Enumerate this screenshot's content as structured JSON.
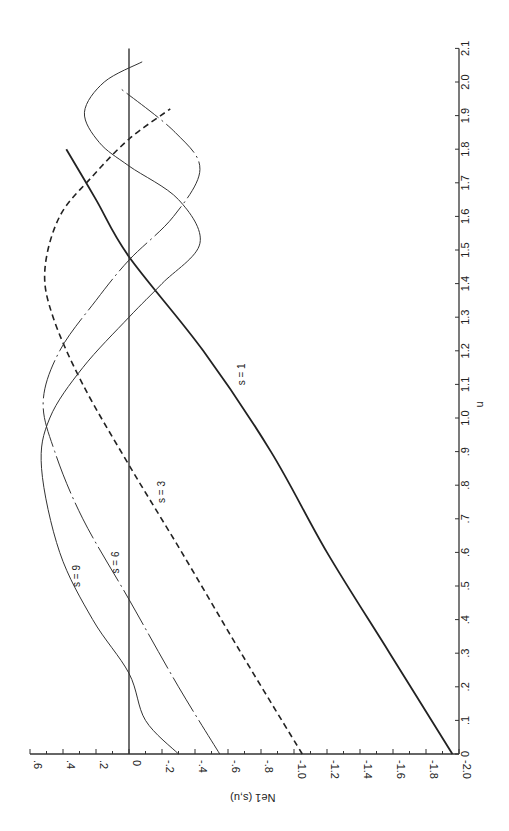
{
  "chart_data": {
    "type": "line",
    "orientation": "rotated-90",
    "title": "",
    "xlabel": "u",
    "ylabel": "Ne1 (s,u)",
    "xlim": [
      0,
      2.1
    ],
    "ylim": [
      -2.0,
      0.6
    ],
    "x_ticks": [
      "0",
      ".1",
      ".2",
      ".3",
      ".4",
      ".5",
      ".6",
      ".7",
      ".8",
      ".9",
      "1.0",
      "1.1",
      "1.2",
      "1.3",
      "1.4",
      "1.5",
      "1.6",
      "1.7",
      "1.8",
      "1.9",
      "2.0",
      "2.1"
    ],
    "x_tick_values": [
      0,
      0.1,
      0.2,
      0.3,
      0.4,
      0.5,
      0.6,
      0.7,
      0.8,
      0.9,
      1.0,
      1.1,
      1.2,
      1.3,
      1.4,
      1.5,
      1.6,
      1.7,
      1.8,
      1.9,
      2.0,
      2.1
    ],
    "y_ticks": [
      ".6",
      ".4",
      ".2",
      "0",
      "-.2",
      "-.4",
      "-.6",
      "-.8",
      "-1.0",
      "-1.2",
      "-1.4",
      "-1.6",
      "-1.8",
      "-2.0"
    ],
    "y_tick_values": [
      0.6,
      0.4,
      0.2,
      0,
      -0.2,
      -0.4,
      -0.6,
      -0.8,
      -1.0,
      -1.2,
      -1.4,
      -1.6,
      -1.8,
      -2.0
    ],
    "grid": false,
    "legend": "inline labels",
    "series": [
      {
        "name": "s = 1",
        "style": "solid-thick",
        "u": [
          0,
          0.3,
          0.6,
          0.9,
          1.2,
          1.48,
          1.65,
          1.8
        ],
        "values": [
          -1.96,
          -1.58,
          -1.2,
          -0.86,
          -0.45,
          0,
          0.2,
          0.38
        ],
        "label_at": [
          1.13,
          -0.7
        ]
      },
      {
        "name": "s = 3",
        "style": "dashed",
        "u": [
          0,
          0.3,
          0.6,
          0.86,
          1.1,
          1.3,
          1.44,
          1.6,
          1.72,
          1.83,
          1.92
        ],
        "values": [
          -1.05,
          -0.68,
          -0.32,
          0,
          0.28,
          0.46,
          0.51,
          0.42,
          0.22,
          0,
          -0.25
        ],
        "label_at": [
          0.78,
          -0.22
        ]
      },
      {
        "name": "s = 6",
        "style": "dash-dot",
        "u": [
          0,
          0.2,
          0.46,
          0.7,
          0.9,
          1.05,
          1.2,
          1.35,
          1.47,
          1.6,
          1.74,
          1.85,
          1.98
        ],
        "values": [
          -0.55,
          -0.3,
          0,
          0.28,
          0.45,
          0.52,
          0.42,
          0.2,
          0,
          -0.27,
          -0.43,
          -0.28,
          0.05
        ],
        "label_at": [
          0.57,
          0.06
        ]
      },
      {
        "name": "s = 9",
        "style": "solid-thin",
        "u": [
          0,
          0.1,
          0.24,
          0.4,
          0.6,
          0.85,
          1.0,
          1.15,
          1.3,
          1.4,
          1.52,
          1.65,
          1.75,
          1.82,
          1.91,
          2.0,
          2.06
        ],
        "values": [
          -0.3,
          -0.1,
          0,
          0.22,
          0.42,
          0.53,
          0.48,
          0.28,
          0,
          -0.2,
          -0.43,
          -0.3,
          0,
          0.18,
          0.27,
          0.15,
          -0.08
        ],
        "label_at": [
          0.53,
          0.3
        ]
      },
      {
        "name": "zero line",
        "style": "solid-reference",
        "u": [
          0,
          2.1
        ],
        "values": [
          0,
          0
        ]
      }
    ]
  }
}
